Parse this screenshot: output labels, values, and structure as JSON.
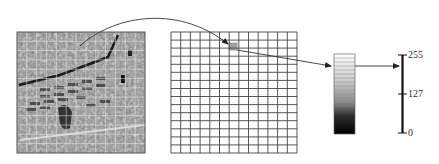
{
  "diagram": {
    "satellite_image": {
      "label": "aerial-image",
      "grid_overlay": {
        "cols": 13,
        "rows": 13,
        "line_color": "#e8e8e8"
      }
    },
    "pixel_grid": {
      "cols": 13,
      "rows": 15,
      "line_color": "#444444",
      "highlighted_cell": {
        "col": 6,
        "row": 1,
        "color": "#a0a0a0"
      }
    },
    "grayscale_bar": {
      "from_color": "#ffffff",
      "to_color": "#000000"
    },
    "scale": {
      "ticks": [
        {
          "value": "255",
          "position": "top"
        },
        {
          "value": "127",
          "position": "middle"
        },
        {
          "value": "0",
          "position": "bottom"
        }
      ]
    },
    "colors": {
      "arrow": "#333333",
      "axis": "#111111"
    }
  }
}
